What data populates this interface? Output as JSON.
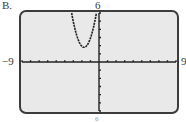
{
  "figure": {
    "panel_label": "B.",
    "ymax_label": "6",
    "ymin_label": "-6",
    "xmin_label": "−9",
    "xmax_label": "9"
  },
  "colors": {
    "screen_bg": "#e9e9e9",
    "frame": "#3c3c3c",
    "axis": "#222222",
    "curve": "#222222"
  },
  "chart_data": {
    "type": "line",
    "title": "",
    "xlabel": "",
    "ylabel": "",
    "xlim": [
      -9,
      9
    ],
    "ylim": [
      -6,
      6
    ],
    "xscale": 1,
    "yscale": 1,
    "grid": false,
    "window_labels": {
      "xmin": "-9",
      "xmax": "9",
      "ymin": "-6",
      "ymax": "6"
    },
    "series": [
      {
        "name": "parabola",
        "description": "upward-opening parabola, vertex approx (-1.75, 1.8)",
        "x": [
          -3.2,
          -3.0,
          -2.75,
          -2.5,
          -2.25,
          -2.0,
          -1.75,
          -1.5,
          -1.25,
          -1.0,
          -0.75,
          -0.5,
          -0.3
        ],
        "y": [
          6.0,
          4.9,
          3.8,
          2.9,
          2.3,
          1.9,
          1.8,
          1.9,
          2.3,
          2.9,
          3.8,
          4.9,
          6.0
        ]
      }
    ]
  }
}
